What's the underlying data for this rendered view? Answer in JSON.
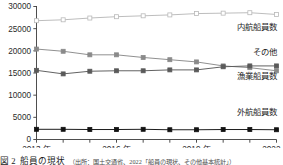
{
  "chart_data": {
    "type": "line",
    "title": "",
    "xlabel": "",
    "ylabel": "",
    "ylim": [
      0,
      30000
    ],
    "xlim": [
      2013,
      2022
    ],
    "grid": false,
    "legend_position": "inline-right",
    "x": [
      2013,
      2014,
      2015,
      2016,
      2017,
      2018,
      2019,
      2020,
      2021,
      2022
    ],
    "xtick_labels": [
      "2013 年",
      "2016 年",
      "2019 年",
      "2022 年"
    ],
    "xtick_values": [
      2013,
      2016,
      2019,
      2022
    ],
    "ytick_labels": [
      "0",
      "5000",
      "10000",
      "15000",
      "20000",
      "25000",
      "30000"
    ],
    "ytick_values": [
      0,
      5000,
      10000,
      15000,
      20000,
      25000,
      30000
    ],
    "series": [
      {
        "name": "内航船員数",
        "color": "#b9b9b9",
        "marker": "open-square",
        "values": [
          26800,
          27000,
          27400,
          27700,
          27900,
          28100,
          28400,
          28500,
          28600,
          28200
        ]
      },
      {
        "name": "その他",
        "color": "#8a8a8a",
        "marker": "filled-square",
        "values": [
          20400,
          19900,
          19100,
          19100,
          18500,
          18000,
          17500,
          16600,
          16200,
          15500
        ]
      },
      {
        "name": "漁業船員数",
        "color": "#5a5a5a",
        "marker": "filled-square",
        "values": [
          15600,
          14800,
          15400,
          15500,
          15500,
          15700,
          15700,
          16400,
          16600,
          16600
        ]
      },
      {
        "name": "外航船員数",
        "color": "#111111",
        "marker": "filled-square",
        "values": [
          2300,
          2300,
          2250,
          2250,
          2300,
          2200,
          2200,
          2250,
          2250,
          2200
        ]
      }
    ],
    "annotations": [
      {
        "text": "内航船員数",
        "x": 2022,
        "y": 24600
      },
      {
        "text": "その他",
        "x": 2022,
        "y": 19000
      },
      {
        "text": "漁業船員数",
        "x": 2022,
        "y": 13600
      },
      {
        "text": "外航船員数",
        "x": 2022,
        "y": 5600
      }
    ]
  },
  "caption": {
    "figure_number": "図 2",
    "title": "船員の現状",
    "source": "（出所：国土交通省、2022「船員の現状、その他基本統計」）"
  }
}
